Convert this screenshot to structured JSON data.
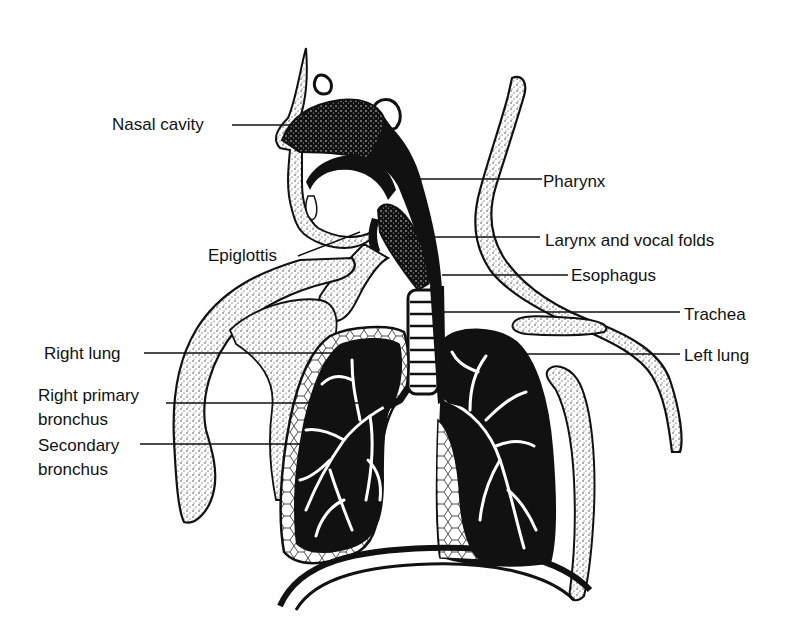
{
  "diagram": {
    "labels": {
      "nasal_cavity": "Nasal cavity",
      "pharynx": "Pharynx",
      "epiglottis": "Epiglottis",
      "larynx": "Larynx and vocal folds",
      "esophagus": "Esophagus",
      "trachea": "Trachea",
      "right_lung": "Right lung",
      "left_lung": "Left lung",
      "right_primary_bronchus": "Right primary\nbronchus",
      "secondary_bronchus": "Secondary\nbronchus"
    },
    "colors": {
      "ink": "#111111",
      "stipple": "#c8c8c8",
      "background": "#ffffff"
    }
  }
}
